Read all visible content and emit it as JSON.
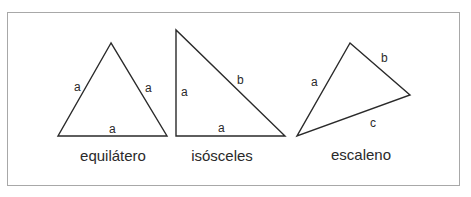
{
  "diagram": {
    "stroke_color": "#2a2a2a",
    "frame_color": "#a8a8a8",
    "triangles": [
      {
        "name": "equilátero",
        "caption": "equilátero",
        "vertices": [
          [
            111,
            43
          ],
          [
            58,
            136
          ],
          [
            167,
            136
          ]
        ],
        "side_labels": [
          {
            "text": "a",
            "x": 78,
            "y": 91
          },
          {
            "text": "a",
            "x": 148,
            "y": 92
          },
          {
            "text": "a",
            "x": 113,
            "y": 133
          }
        ]
      },
      {
        "name": "isósceles",
        "caption": "isósceles",
        "vertices": [
          [
            176,
            30
          ],
          [
            176,
            136
          ],
          [
            285,
            136
          ]
        ],
        "side_labels": [
          {
            "text": "a",
            "x": 184,
            "y": 96
          },
          {
            "text": "b",
            "x": 240,
            "y": 84
          },
          {
            "text": "a",
            "x": 221,
            "y": 132
          }
        ]
      },
      {
        "name": "escaleno",
        "caption": "escaleno",
        "vertices": [
          [
            350,
            43
          ],
          [
            410,
            95
          ],
          [
            297,
            136
          ]
        ],
        "side_labels": [
          {
            "text": "a",
            "x": 314,
            "y": 86
          },
          {
            "text": "b",
            "x": 384,
            "y": 62
          },
          {
            "text": "c",
            "x": 373,
            "y": 127
          }
        ]
      }
    ]
  }
}
